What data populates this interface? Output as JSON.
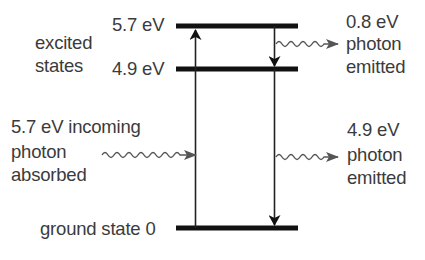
{
  "diagram": {
    "type": "energy-level diagram",
    "group_label": [
      "excited",
      "states"
    ],
    "levels": [
      {
        "name": "excited-level-2",
        "label": "5.7 eV",
        "value_ev": 5.7
      },
      {
        "name": "excited-level-1",
        "label": "4.9 eV",
        "value_ev": 4.9
      },
      {
        "name": "ground-level",
        "label": "ground state 0",
        "value_ev": 0
      }
    ],
    "absorption": {
      "lines": [
        "5.7 eV incoming",
        "photon",
        "absorbed"
      ],
      "energy_ev": 5.7
    },
    "emission_top": {
      "lines": [
        "0.8 eV",
        "photon",
        "emitted"
      ],
      "energy_ev": 0.8
    },
    "emission_bottom": {
      "lines": [
        "4.9 eV",
        "photon",
        "emitted"
      ],
      "energy_ev": 4.9
    },
    "colors": {
      "text": "#3b3b3b",
      "level_line": "#111111",
      "arrow": "#222222",
      "wave": "#555555"
    }
  }
}
